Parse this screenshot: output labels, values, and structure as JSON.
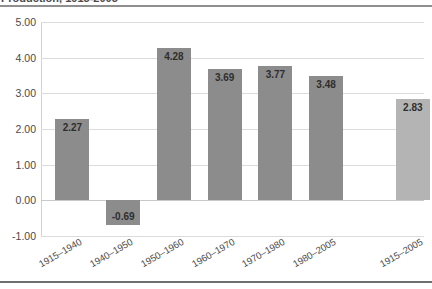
{
  "title": "Production, 1915-2005",
  "chart_data": {
    "type": "bar",
    "title": "Production, 1915-2005",
    "xlabel": "",
    "ylabel": "",
    "categories": [
      "1915–1940",
      "1940–1950",
      "1950–1960",
      "1960–1970",
      "1970–1980",
      "1980–2005",
      "1915–2005"
    ],
    "values": [
      2.27,
      -0.69,
      4.28,
      3.69,
      3.77,
      3.48,
      2.83
    ],
    "value_labels": [
      "2.27",
      "-0.69",
      "4.28",
      "3.69",
      "3.77",
      "3.48",
      "2.83"
    ],
    "ylim": [
      -1.0,
      5.0
    ],
    "yticks": [
      5.0,
      4.0,
      3.0,
      2.0,
      1.0,
      0.0,
      -1.0
    ],
    "ytick_labels": [
      "5.00",
      "4.00",
      "3.00",
      "2.00",
      "1.00",
      "0.00",
      "-1.00"
    ],
    "grid": true,
    "legend": false,
    "bar_colors": [
      "#8c8c8c",
      "#8c8c8c",
      "#8c8c8c",
      "#8c8c8c",
      "#8c8c8c",
      "#8c8c8c",
      "#b4b4b4"
    ],
    "summary_index": 6
  },
  "colors": {
    "bar": "#8c8c8c",
    "summary_bar": "#b4b4b4",
    "gridline": "#dcdcdc",
    "text": "#4a4a4a",
    "rule": "#6e6e6e"
  }
}
